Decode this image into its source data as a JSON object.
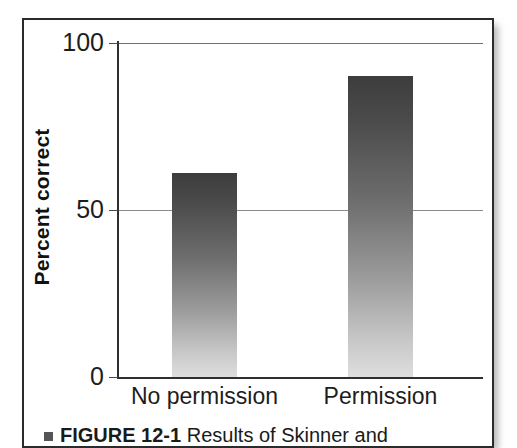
{
  "figure": {
    "caption_label": "FIGURE 12-1",
    "caption_text": "Results of Skinner and",
    "bullet_icon": "square-bullet-icon"
  },
  "chart_data": {
    "type": "bar",
    "title": "",
    "subtitle": "",
    "xlabel": "",
    "ylabel": "Percent correct",
    "categories": [
      "No permission",
      "Permission"
    ],
    "values": [
      61,
      90
    ],
    "series": [
      {
        "name": "Percent correct",
        "values": [
          61,
          90
        ]
      }
    ],
    "ylim": [
      0,
      100
    ],
    "ytick_labels": [
      "0",
      "50",
      "100"
    ],
    "ytick_values": [
      0,
      50,
      100
    ],
    "grid": "horizontal",
    "gridlines_at": [
      50,
      100
    ],
    "legend": "none",
    "legend_position": "none",
    "bar_fill": "vertical-gradient-dark-to-light",
    "colors": {
      "bar_top": "#3d3d3d",
      "bar_bottom": "#dedede",
      "axis": "#2f2f2f",
      "gridline": "#8a8a8a",
      "text": "#1d1d1d",
      "panel_border": "#2b2b2b",
      "background": "#ffffff"
    }
  }
}
